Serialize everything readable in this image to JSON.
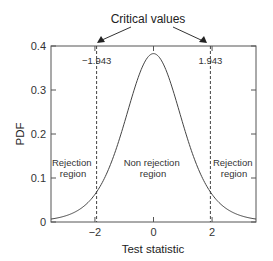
{
  "chart_data": {
    "type": "line",
    "title": "",
    "xlabel": "Test statistic",
    "ylabel": "PDF",
    "xlim": [
      -3.5,
      3.5
    ],
    "ylim": [
      0,
      0.4
    ],
    "grid": false,
    "x_ticks": [
      -2,
      0,
      2
    ],
    "x_tick_labels": [
      "−2",
      "0",
      "2"
    ],
    "y_ticks": [
      0,
      0.1,
      0.2,
      0.3,
      0.4
    ],
    "y_tick_labels": [
      "0",
      "0.1",
      "0.2",
      "0.3",
      "0.4"
    ],
    "series": [
      {
        "name": "t-distribution PDF",
        "x": [
          -3.5,
          -3.0,
          -2.5,
          -2.0,
          -1.5,
          -1.0,
          -0.5,
          0,
          0.5,
          1.0,
          1.5,
          2.0,
          2.5,
          3.0,
          3.5
        ],
        "values": [
          0.006,
          0.012,
          0.027,
          0.064,
          0.128,
          0.23,
          0.335,
          0.383,
          0.335,
          0.23,
          0.128,
          0.064,
          0.027,
          0.012,
          0.006
        ]
      }
    ],
    "critical_values": [
      -1.943,
      1.943
    ],
    "critical_value_labels": [
      "−1.943",
      "1.943"
    ],
    "annotations": {
      "critical_values_title": "Critical values",
      "left_region": [
        "Rejection",
        "region"
      ],
      "middle_region": [
        "Non rejection",
        "region"
      ],
      "right_region": [
        "Rejection",
        "region"
      ]
    }
  }
}
